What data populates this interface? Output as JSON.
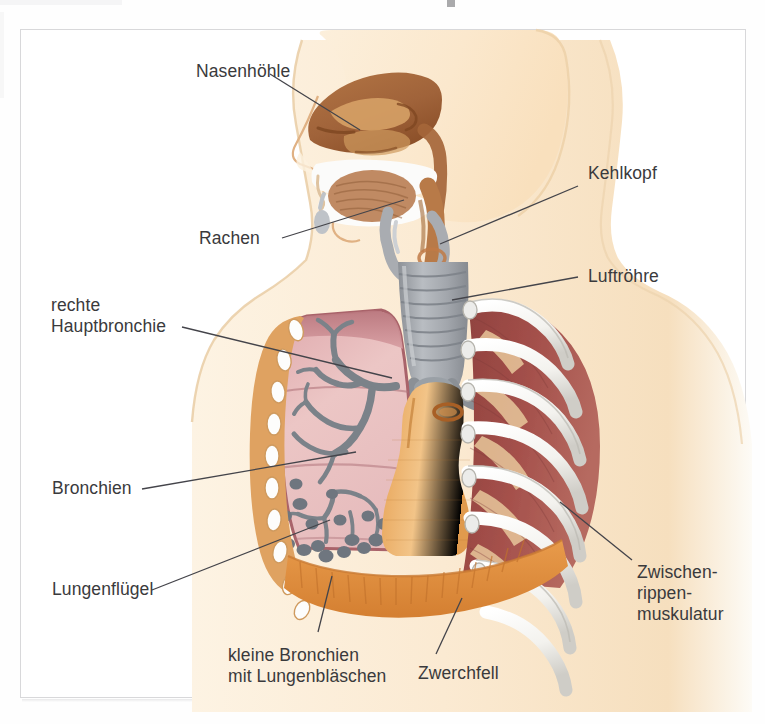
{
  "figure": {
    "kind": "anatomical-diagram",
    "language": "de",
    "background_color": "#ffffff",
    "frame_border_color": "#d8d8da",
    "label_text_color": "#3a3a3c",
    "leader_line_color": "#44444a"
  },
  "labels": {
    "nasenhoehle": "Nasenhöhle",
    "rachen": "Rachen",
    "kehlkopf": "Kehlkopf",
    "luftroehre": "Luftröhre",
    "rechte_hauptbronchie_l1": "rechte",
    "rechte_hauptbronchie_l2": "Hauptbronchie",
    "bronchien": "Bronchien",
    "lungenfluegel": "Lungenflügel",
    "kleine_bronchien_l1": "kleine Bronchien",
    "kleine_bronchien_l2": "mit Lungenbläschen",
    "zwerchfell": "Zwerchfell",
    "zwischenrippenmuskulatur_l1": "Zwischen-",
    "zwischenrippenmuskulatur_l2": "rippen-",
    "zwischenrippenmuskulatur_l3": "muskulatur"
  },
  "palette": {
    "skin_light": "#fdf0dc",
    "skin_mid": "#f8e2c2",
    "skin_edge": "#e8c79a",
    "nasal_brown": "#a5663a",
    "nasal_brown_dark": "#8d5228",
    "pharynx_brown": "#b87a48",
    "palate_white": "#fbfbfb",
    "tongue": "#c08a63",
    "cartilage_grey": "#a9acb1",
    "cartilage_grey_dark": "#85888e",
    "bronchi_grey": "#7b8289",
    "alveoli_grey": "#6f767f",
    "lung_pink": "#e3b4b6",
    "lung_pink_light": "#edc6c6",
    "lung_border": "#a9636a",
    "rib_white": "#fbfbfa",
    "rib_shade": "#d9d8d4",
    "intercostal_red": "#9d4a46",
    "intercostal_tan": "#e8c79c",
    "mediastinum": "#e8a759",
    "mediastinum_light": "#f0bd7c",
    "diaphragm": "#e09448",
    "diaphragm_dark": "#c97a33",
    "ribband_tan": "#dfa261"
  }
}
